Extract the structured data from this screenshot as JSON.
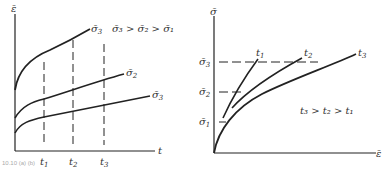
{
  "left_panel": {
    "y_axis_label": "ε̄",
    "x_axis_label": "t",
    "curves": [
      {
        "label": "σ̄",
        "sub": "3"
      },
      {
        "label": "σ̄",
        "sub": "2"
      },
      {
        "label": "σ̄",
        "sub": "3"
      }
    ],
    "relation": "σ̄₃ > σ̄₂ > σ̄₁",
    "time_marks": [
      {
        "label": "t",
        "sub": "1"
      },
      {
        "label": "t",
        "sub": "2"
      },
      {
        "label": "t",
        "sub": "3"
      }
    ]
  },
  "right_panel": {
    "y_axis_label": "σ̄",
    "x_axis_label": "ε̄",
    "stress_marks": [
      {
        "label": "σ̄",
        "sub": "3"
      },
      {
        "label": "σ̄",
        "sub": "2"
      },
      {
        "label": "σ̄",
        "sub": "1"
      }
    ],
    "curves": [
      {
        "label": "t",
        "sub": "1"
      },
      {
        "label": "t",
        "sub": "2"
      },
      {
        "label": "t",
        "sub": "3"
      }
    ],
    "relation": "t₃ > t₂ > t₁"
  },
  "caption": "10.10 (a)   (b)"
}
